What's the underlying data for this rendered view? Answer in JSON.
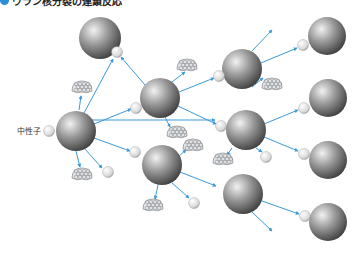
{
  "title": "ウラン核分裂の連鎖反応",
  "labels": {
    "neutron": "中性子"
  },
  "colors": {
    "arrow": "#3a9ad9",
    "title_bullet": "#2a8fd6"
  },
  "nuclei": [
    {
      "id": "A",
      "x": 76,
      "y": 131,
      "r": 20
    },
    {
      "id": "B",
      "x": 100,
      "y": 38,
      "r": 21
    },
    {
      "id": "C",
      "x": 160,
      "y": 98,
      "r": 20
    },
    {
      "id": "D",
      "x": 162,
      "y": 165,
      "r": 20
    },
    {
      "id": "E",
      "x": 242,
      "y": 69,
      "r": 20
    },
    {
      "id": "F",
      "x": 246,
      "y": 130,
      "r": 20
    },
    {
      "id": "G",
      "x": 243,
      "y": 194,
      "r": 20
    },
    {
      "id": "H",
      "x": 327,
      "y": 36,
      "r": 19
    },
    {
      "id": "I",
      "x": 328,
      "y": 98,
      "r": 19
    },
    {
      "id": "J",
      "x": 328,
      "y": 160,
      "r": 19
    },
    {
      "id": "K",
      "x": 328,
      "y": 222,
      "r": 19
    }
  ],
  "neutrons": [
    {
      "x": 49,
      "y": 131
    },
    {
      "x": 117,
      "y": 52
    },
    {
      "x": 136,
      "y": 108
    },
    {
      "x": 135,
      "y": 152
    },
    {
      "x": 108,
      "y": 172
    },
    {
      "x": 219,
      "y": 76
    },
    {
      "x": 221,
      "y": 126
    },
    {
      "x": 266,
      "y": 157
    },
    {
      "x": 194,
      "y": 203
    },
    {
      "x": 303,
      "y": 45
    },
    {
      "x": 304,
      "y": 108
    },
    {
      "x": 304,
      "y": 154
    },
    {
      "x": 305,
      "y": 216
    }
  ],
  "fragments": [
    {
      "x": 82,
      "y": 88
    },
    {
      "x": 82,
      "y": 175
    },
    {
      "x": 187,
      "y": 66
    },
    {
      "x": 177,
      "y": 133
    },
    {
      "x": 193,
      "y": 146
    },
    {
      "x": 153,
      "y": 206
    },
    {
      "x": 272,
      "y": 85
    },
    {
      "x": 223,
      "y": 160
    }
  ],
  "arrows": [
    {
      "x1": 92,
      "y1": 120,
      "x2": 215,
      "y2": 120
    },
    {
      "x1": 84,
      "y1": 113,
      "x2": 113,
      "y2": 59
    },
    {
      "x1": 94,
      "y1": 124,
      "x2": 131,
      "y2": 109
    },
    {
      "x1": 94,
      "y1": 138,
      "x2": 130,
      "y2": 151
    },
    {
      "x1": 76,
      "y1": 151,
      "x2": 80,
      "y2": 167
    },
    {
      "x1": 84,
      "y1": 148,
      "x2": 102,
      "y2": 168
    },
    {
      "x1": 79,
      "y1": 110,
      "x2": 81,
      "y2": 96
    },
    {
      "x1": 145,
      "y1": 85,
      "x2": 121,
      "y2": 57
    },
    {
      "x1": 172,
      "y1": 82,
      "x2": 185,
      "y2": 72
    },
    {
      "x1": 179,
      "y1": 92,
      "x2": 214,
      "y2": 78
    },
    {
      "x1": 178,
      "y1": 106,
      "x2": 216,
      "y2": 124
    },
    {
      "x1": 165,
      "y1": 117,
      "x2": 170,
      "y2": 127
    },
    {
      "x1": 178,
      "y1": 157,
      "x2": 186,
      "y2": 150
    },
    {
      "x1": 180,
      "y1": 172,
      "x2": 216,
      "y2": 186
    },
    {
      "x1": 158,
      "y1": 185,
      "x2": 155,
      "y2": 199
    },
    {
      "x1": 172,
      "y1": 183,
      "x2": 189,
      "y2": 198
    },
    {
      "x1": 252,
      "y1": 51,
      "x2": 272,
      "y2": 30
    },
    {
      "x1": 261,
      "y1": 63,
      "x2": 297,
      "y2": 48
    },
    {
      "x1": 252,
      "y1": 87,
      "x2": 263,
      "y2": 78
    },
    {
      "x1": 264,
      "y1": 124,
      "x2": 298,
      "y2": 110
    },
    {
      "x1": 264,
      "y1": 137,
      "x2": 298,
      "y2": 151
    },
    {
      "x1": 232,
      "y1": 148,
      "x2": 227,
      "y2": 155
    },
    {
      "x1": 256,
      "y1": 148,
      "x2": 262,
      "y2": 152
    },
    {
      "x1": 262,
      "y1": 201,
      "x2": 299,
      "y2": 214
    },
    {
      "x1": 252,
      "y1": 212,
      "x2": 272,
      "y2": 231
    }
  ]
}
